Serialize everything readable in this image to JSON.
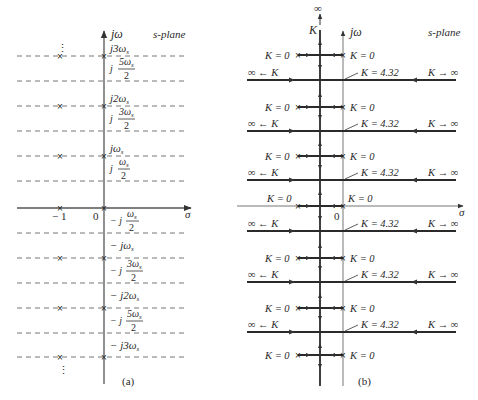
{
  "panel_a": {
    "caption": "(a)",
    "plane_label": "s-plane",
    "axis_imag": "jω",
    "axis_real": "σ",
    "origin_label": "0",
    "minus_one_label": "− 1",
    "freq_labels_upper": [
      {
        "main": "j3ω",
        "sub": "s"
      },
      {
        "main": "j2ω",
        "sub": "s"
      },
      {
        "main": "jω",
        "sub": "s"
      }
    ],
    "half_labels_upper": [
      {
        "pre": "j",
        "num": "5ω",
        "sub": "s",
        "den": "2"
      },
      {
        "pre": "j",
        "num": "3ω",
        "sub": "s",
        "den": "2"
      },
      {
        "pre": "j",
        "num": "ω",
        "sub": "s",
        "den": "2"
      }
    ],
    "half_labels_lower": [
      {
        "pre": "− j",
        "num": "ω",
        "sub": "s",
        "den": "2"
      },
      {
        "pre": "− j",
        "num": "3ω",
        "sub": "s",
        "den": "2"
      },
      {
        "pre": "− j",
        "num": "5ω",
        "sub": "s",
        "den": "2"
      }
    ],
    "freq_labels_lower": [
      {
        "main": "− jω",
        "sub": "s"
      },
      {
        "main": "− j2ω",
        "sub": "s"
      },
      {
        "main": "− j3ω",
        "sub": "s"
      }
    ],
    "ellipsis": "⋮"
  },
  "panel_b": {
    "caption": "(b)",
    "plane_label": "s-plane",
    "axis_imag": "jω",
    "axis_real": "σ",
    "origin_label": "0",
    "infinity_top": "∞",
    "k_top": "K",
    "k_zero": "K = 0",
    "k_break": "K = 4.32",
    "left_arrow_label": "∞ ← K",
    "right_arrow_label": "K → ∞"
  }
}
